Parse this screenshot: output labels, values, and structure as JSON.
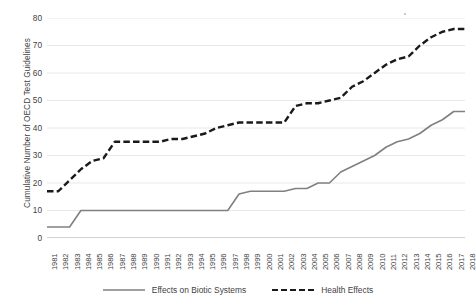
{
  "chart_data": {
    "type": "line",
    "title": "",
    "xlabel": "",
    "ylabel": "Cumulative Number of OECD Test Guidelines",
    "ylim": [
      0,
      80
    ],
    "yticks": [
      0,
      10,
      20,
      30,
      40,
      50,
      60,
      70,
      80
    ],
    "grid": true,
    "legend_position": "bottom",
    "categories": [
      "1981",
      "1982",
      "1983",
      "1984",
      "1985",
      "1986",
      "1987",
      "1988",
      "1989",
      "1990",
      "1991",
      "1992",
      "1993",
      "1994",
      "1995",
      "1996",
      "1997",
      "1998",
      "1999",
      "2000",
      "2001",
      "2002",
      "2003",
      "2004",
      "2005",
      "2006",
      "2007",
      "2008",
      "2009",
      "2010",
      "2011",
      "2012",
      "2013",
      "2014",
      "2015",
      "2016",
      "2017",
      "2018"
    ],
    "series": [
      {
        "name": "Effects on Biotic Systems",
        "style": "solid",
        "color": "#808080",
        "values": [
          4,
          4,
          4,
          10,
          10,
          10,
          10,
          10,
          10,
          10,
          10,
          10,
          10,
          10,
          10,
          10,
          10,
          16,
          17,
          17,
          17,
          17,
          18,
          18,
          20,
          20,
          24,
          26,
          28,
          30,
          33,
          35,
          36,
          38,
          41,
          43,
          46,
          46
        ]
      },
      {
        "name": "Health Effects",
        "style": "dashed",
        "color": "#1a1a1a",
        "values": [
          17,
          17,
          21,
          25,
          28,
          29,
          35,
          35,
          35,
          35,
          35,
          36,
          36,
          37,
          38,
          40,
          41,
          42,
          42,
          42,
          42,
          42,
          48,
          49,
          49,
          50,
          51,
          55,
          57,
          60,
          63,
          65,
          66,
          70,
          73,
          75,
          76,
          76
        ]
      }
    ]
  },
  "legend": {
    "items": [
      {
        "label": "Effects on Biotic Systems"
      },
      {
        "label": "Health Effects"
      }
    ]
  }
}
